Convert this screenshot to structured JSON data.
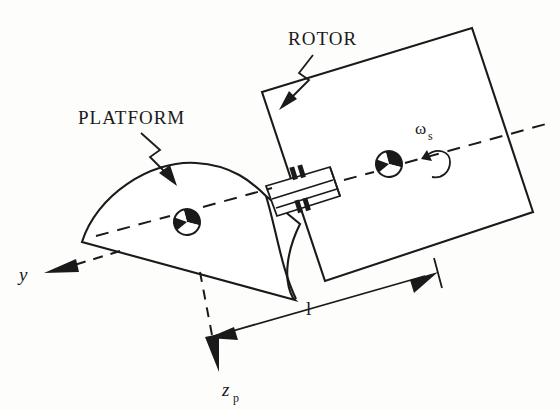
{
  "figure": {
    "background_color": "#fdfdfc",
    "ink_color": "#1a1a1a"
  },
  "labels": {
    "platform": "PLATFORM",
    "rotor": "ROTOR",
    "spin_rate_symbol": "ω",
    "spin_rate_subscript": "s",
    "axis_y": "y",
    "axis_z": "z",
    "axis_z_subscript": "p",
    "dimension_length": "l"
  },
  "components": {
    "rotor_body": "rotor-rectangle",
    "platform_body": "platform-wedge",
    "shaft": "connecting-shaft",
    "bearings": "bearing-pair",
    "mass_center_platform": "center-of-mass-marker",
    "mass_center_rotor": "center-of-mass-marker",
    "spin_axis": "dashed-spin-axis"
  },
  "annotations": {
    "platform_leader": "zigzag-leader-line",
    "rotor_leader": "zigzag-leader-line",
    "length_dimension": "double-headed-dimension-arrow",
    "y_axis_arrow": "dashed-axis-arrow",
    "z_axis_arrow": "dashed-axis-arrow",
    "spin_arrow": "curved-rotation-arrow"
  }
}
